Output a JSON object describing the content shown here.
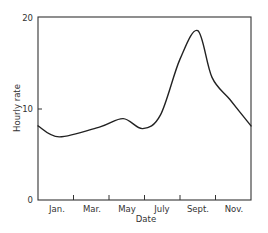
{
  "chart_data": {
    "type": "line",
    "title": "",
    "xlabel": "Date",
    "ylabel": "Hourly rate",
    "ylim": [
      0,
      20
    ],
    "yticks": [
      0,
      10,
      20
    ],
    "ytick_labels": [
      "0",
      "10",
      "20"
    ],
    "xtick_labels": [
      "Jan.",
      "Mar.",
      "May",
      "July",
      "Sept.",
      "Nov."
    ],
    "grid": false,
    "legend": null,
    "series": [
      {
        "name": "Hourly rate",
        "x": [
          0.0,
          1.2,
          3.5,
          4.8,
          5.9,
          6.9,
          8.0,
          9.0,
          9.8,
          10.8,
          12.0
        ],
        "values": [
          8.1,
          6.9,
          8.0,
          8.9,
          7.8,
          9.3,
          15.4,
          18.5,
          13.4,
          11.0,
          8.1
        ]
      }
    ]
  }
}
